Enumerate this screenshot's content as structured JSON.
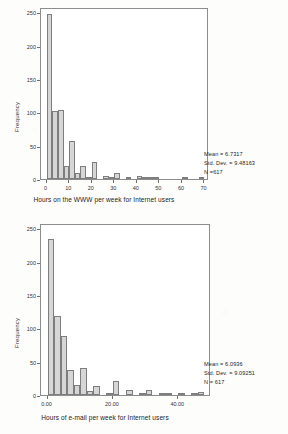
{
  "document": {
    "background_color": "#fdfdfc",
    "bar_fill_color": "#d6d6d6",
    "bar_border_color": "#7e7e7e",
    "axis_color": "#8d8d8d"
  },
  "chart_data": [
    {
      "type": "bar",
      "title": "",
      "xlabel": "Hours on the WWW per week for Internet users",
      "ylabel": "Frequency",
      "xlim": [
        -2.5,
        72
      ],
      "ylim": [
        0,
        258
      ],
      "grid": false,
      "legend": "none",
      "xticks": [
        "0",
        "10",
        "20",
        "30",
        "40",
        "50",
        "60",
        "70"
      ],
      "xtick_values": [
        0,
        10,
        20,
        30,
        40,
        50,
        60,
        70
      ],
      "yticks": [
        "0",
        "50",
        "100",
        "150",
        "200",
        "250"
      ],
      "ytick_values": [
        0,
        50,
        100,
        150,
        200,
        250
      ],
      "bin_width": 2.5,
      "x": [
        1.25,
        3.75,
        6.25,
        8.75,
        11.25,
        13.75,
        16.25,
        18.75,
        21.25,
        23.75,
        26.25,
        28.75,
        31.25,
        33.75,
        36.25,
        38.75,
        41.25,
        43.75,
        46.25,
        48.75,
        51.25,
        56.25,
        61.25,
        66.25,
        68.75
      ],
      "values": [
        248,
        102,
        103,
        19,
        57,
        9,
        20,
        1,
        26,
        0,
        4,
        2,
        9,
        0,
        1,
        0,
        4,
        1,
        1,
        2,
        0,
        0,
        1,
        0,
        1
      ],
      "annotations": {
        "mean_label": "Mean = 6.7317",
        "std_dev_label": "Std. Dev. = 9.48163",
        "n_label": "N =617",
        "mean": 6.7317,
        "std_dev": 9.48163,
        "n": 617
      }
    },
    {
      "type": "bar",
      "title": "",
      "xlabel": "Hours of e-mail per week for Internet users",
      "ylabel": "Frequency",
      "xlim": [
        -2,
        50
      ],
      "ylim": [
        0,
        258
      ],
      "grid": false,
      "legend": "none",
      "xticks": [
        "0.00",
        "20.00",
        "40.00"
      ],
      "xtick_values": [
        0,
        20,
        40
      ],
      "yticks": [
        "0",
        "50",
        "100",
        "150",
        "200",
        "250"
      ],
      "ytick_values": [
        0,
        50,
        100,
        150,
        200,
        250
      ],
      "bin_width": 2,
      "x": [
        1,
        3,
        5,
        7,
        9,
        11,
        13,
        15,
        17,
        19,
        21,
        23,
        25,
        27,
        29,
        31,
        33,
        35,
        37,
        39,
        41,
        43,
        45,
        47
      ],
      "values": [
        234,
        118,
        88,
        37,
        15,
        41,
        6,
        14,
        0,
        1,
        21,
        0,
        7,
        0,
        3,
        8,
        0,
        2,
        1,
        0,
        2,
        0,
        1,
        5
      ],
      "annotations": {
        "mean_label": "Mean = 6.0936",
        "std_dev_label": "Std. Dev. = 9.09251",
        "n_label": "N = 617",
        "mean": 6.0936,
        "std_dev": 9.09251,
        "n": 617
      }
    }
  ]
}
